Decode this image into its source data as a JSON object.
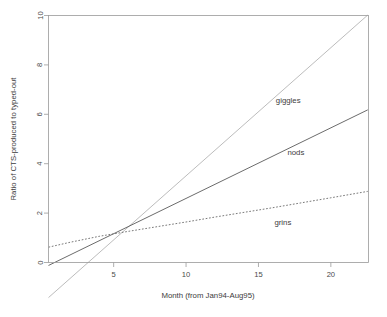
{
  "chart_data": {
    "type": "line",
    "title": "",
    "xlabel": "Month (from Jan94-Aug95)",
    "ylabel": "Ratio of CTS-produced to typed-out",
    "xlim": [
      0.5,
      22.6
    ],
    "ylim": [
      0,
      10
    ],
    "xticks": [
      5,
      10,
      15,
      20
    ],
    "yticks": [
      0,
      2,
      4,
      6,
      8,
      10
    ],
    "xtick_labels": [
      "5",
      "10",
      "15",
      "20"
    ],
    "ytick_labels": [
      "0",
      "2",
      "4",
      "6",
      "8",
      "10"
    ],
    "grid": false,
    "legend_position": "inline-annotations",
    "series": [
      {
        "name": "giggles",
        "style": "solid",
        "color": "#b4b4b4",
        "width": 0.9,
        "label": "giggles",
        "label_x": 16.2,
        "label_y": 6.45,
        "x": [
          0.5,
          22.55
        ],
        "values": [
          -1.42,
          10.02
        ]
      },
      {
        "name": "nods",
        "style": "solid",
        "color": "#5a5a5a",
        "width": 0.9,
        "label": "nods",
        "label_x": 17.0,
        "label_y": 4.35,
        "x": [
          0.5,
          22.55
        ],
        "values": [
          -0.12,
          6.18
        ]
      },
      {
        "name": "grins",
        "style": "dotted",
        "color": "#6a6a6a",
        "width": 0.9,
        "label": "grins",
        "label_x": 16.1,
        "label_y": 1.52,
        "x": [
          0.5,
          2.0,
          4.0,
          6.0,
          8.0,
          10.0,
          12.0,
          14.0,
          16.0,
          18.0,
          20.0,
          22.55
        ],
        "values": [
          0.62,
          0.82,
          1.06,
          1.26,
          1.45,
          1.64,
          1.84,
          2.03,
          2.22,
          2.42,
          2.62,
          2.88
        ]
      }
    ]
  },
  "axes": {
    "x_title": "Month (from Jan94-Aug95)",
    "y_title": "Ratio of CTS-produced to typed-out"
  }
}
